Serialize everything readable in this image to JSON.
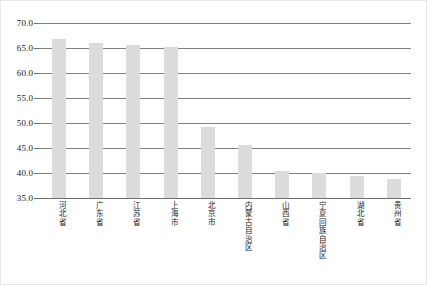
{
  "chart_data": {
    "type": "bar",
    "title": "",
    "subtitle": "",
    "xlabel": "",
    "ylabel": "",
    "ylim": [
      35.0,
      70.0
    ],
    "ytick_step": 5.0,
    "yticks": [
      "70.0",
      "65.0",
      "60.0",
      "55.0",
      "50.0",
      "45.0",
      "40.0",
      "35.0"
    ],
    "ytick_values": [
      70.0,
      65.0,
      60.0,
      55.0,
      50.0,
      45.0,
      40.0,
      35.0
    ],
    "grid": "horizontal",
    "legend": "none",
    "categories": [
      "河北省",
      "广东省",
      "江苏省",
      "上海市",
      "北京市",
      "内蒙古自治区",
      "山西省",
      "宁夏回族自治区",
      "湖北省",
      "贵州省"
    ],
    "values": [
      66.8,
      66.0,
      65.7,
      65.3,
      49.3,
      45.6,
      40.5,
      40.0,
      39.5,
      38.8
    ],
    "bar_color": "#dcdcdc",
    "gridline_color": "#808080",
    "text_color": "#1a1a1a"
  }
}
